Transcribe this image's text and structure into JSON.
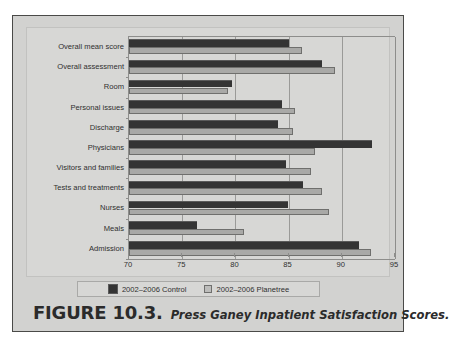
{
  "figure": {
    "caption_number": "FIGURE 10.3.",
    "caption_title": "Press Ganey Inpatient Satisfaction Scores."
  },
  "legend": {
    "entries": [
      {
        "label": "2002–2006 Control",
        "color": "#343434",
        "swatch": "control-swatch"
      },
      {
        "label": "2002–2006 Planetree",
        "color": "#bdbdbb",
        "swatch": "planetree-swatch"
      }
    ]
  },
  "colors": {
    "page_background": "#d2d2d0",
    "panel_background": "#d7d7d5",
    "frame_border": "#4a4a48",
    "gridline": "#9a9a98",
    "series_control": "#343434",
    "series_planetree": "#a9a9a7",
    "text": "#2f2f2f"
  },
  "chart_data": {
    "type": "bar",
    "orientation": "horizontal",
    "title": "Press Ganey Inpatient Satisfaction Scores.",
    "xlabel": "",
    "ylabel": "",
    "xlim": [
      70,
      95
    ],
    "xticks": [
      70,
      75,
      80,
      85,
      90,
      95
    ],
    "xtick_labels": [
      "70",
      "75",
      "80",
      "85",
      "90",
      "95"
    ],
    "grid": true,
    "grid_axis": "x",
    "legend_position": "bottom",
    "categories": [
      "Overall mean score",
      "Overall assessment",
      "Room",
      "Personal issues",
      "Discharge",
      "Physicians",
      "Visitors and families",
      "Tests and treatments",
      "Nurses",
      "Meals",
      "Admission"
    ],
    "series": [
      {
        "name": "2002–2006 Control",
        "color": "#343434",
        "values": [
          85.0,
          88.1,
          79.7,
          84.4,
          84.0,
          92.8,
          84.8,
          86.4,
          84.9,
          76.4,
          91.6
        ]
      },
      {
        "name": "2002–2006 Planetree",
        "color": "#a9a9a7",
        "values": [
          86.3,
          89.4,
          79.3,
          85.6,
          85.4,
          87.5,
          87.1,
          88.1,
          88.8,
          80.8,
          92.7
        ]
      }
    ]
  }
}
